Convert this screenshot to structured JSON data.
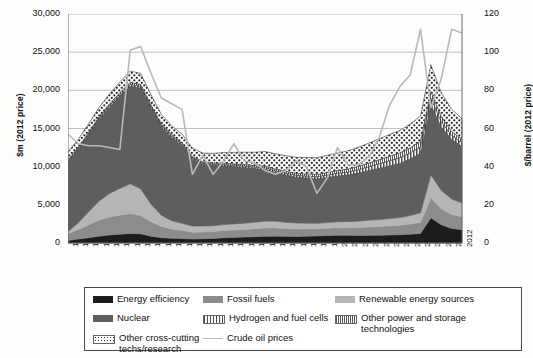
{
  "chart_data": {
    "type": "area",
    "title": "",
    "subtitle": "",
    "xlabel": "",
    "ylabel": "$m (2012 price)",
    "ylabel_right": "$/barrel (2012 price)",
    "ylim": [
      0,
      30000
    ],
    "ylim_right": [
      0,
      120
    ],
    "yticks": [
      "0",
      "5,000",
      "10,000",
      "15,000",
      "20,000",
      "25,000",
      "30,000"
    ],
    "ytick_values": [
      0,
      5000,
      10000,
      15000,
      20000,
      25000,
      30000
    ],
    "yticks_right": [
      "0",
      "20",
      "40",
      "60",
      "80",
      "100",
      "120"
    ],
    "ytick_values_right": [
      0,
      20,
      40,
      60,
      80,
      100,
      120
    ],
    "grid": true,
    "legend_position": "bottom",
    "stacked": true,
    "categories": [
      "1974",
      "1975",
      "1976",
      "1977",
      "1978",
      "1979",
      "1980",
      "1981",
      "1982",
      "1983",
      "1984",
      "1985",
      "1986",
      "1987",
      "1988",
      "1989",
      "1990",
      "1991",
      "1992",
      "1993",
      "1994",
      "1995",
      "1996",
      "1997",
      "1998",
      "1999",
      "2000",
      "2001",
      "2002",
      "2003",
      "2004",
      "2005",
      "2006",
      "2007",
      "2008",
      "2009",
      "2010",
      "2011",
      "2012"
    ],
    "series": [
      {
        "name": "Energy efficiency",
        "color": "#1c1c1c",
        "pattern": "solid",
        "values": [
          320,
          520,
          700,
          900,
          1050,
          1150,
          1250,
          1200,
          900,
          700,
          620,
          580,
          520,
          560,
          600,
          680,
          720,
          780,
          830,
          880,
          900,
          880,
          860,
          900,
          930,
          980,
          1020,
          1000,
          980,
          1000,
          1020,
          1050,
          1080,
          1150,
          1250,
          3300,
          2400,
          1900,
          1750
        ]
      },
      {
        "name": "Fossil fuels",
        "color": "#8c8c8c",
        "pattern": "solid",
        "values": [
          900,
          1250,
          1700,
          2100,
          2350,
          2500,
          2600,
          2400,
          1900,
          1500,
          1200,
          1050,
          900,
          880,
          900,
          950,
          980,
          1000,
          1050,
          1100,
          1080,
          1020,
          980,
          950,
          930,
          950,
          980,
          1000,
          1050,
          1100,
          1150,
          1200,
          1250,
          1350,
          1450,
          2600,
          2100,
          1850,
          1700
        ]
      },
      {
        "name": "Renewable energy sources",
        "color": "#b5b5b5",
        "pattern": "solid",
        "values": [
          250,
          900,
          1700,
          2500,
          3100,
          3500,
          3900,
          3500,
          2300,
          1450,
          1100,
          950,
          800,
          780,
          760,
          780,
          800,
          820,
          850,
          880,
          860,
          820,
          780,
          750,
          720,
          750,
          780,
          800,
          830,
          880,
          900,
          950,
          1000,
          1100,
          1250,
          3000,
          2400,
          2000,
          1800
        ]
      },
      {
        "name": "Nuclear",
        "color": "#5e5e5e",
        "pattern": "solid",
        "values": [
          9200,
          9600,
          10100,
          10700,
          11300,
          12100,
          12800,
          13200,
          12600,
          11600,
          10900,
          10200,
          8800,
          8100,
          7900,
          7700,
          7500,
          7300,
          7000,
          6800,
          6400,
          6200,
          6000,
          5900,
          5800,
          5900,
          6000,
          6100,
          6300,
          6500,
          6700,
          6900,
          7100,
          7400,
          7800,
          9200,
          8300,
          7800,
          7400
        ]
      },
      {
        "name": "Hydrogen and fuel cells",
        "color": "#6f6f6f",
        "pattern": "hatch-vertical",
        "values": [
          120,
          140,
          160,
          180,
          200,
          220,
          240,
          230,
          200,
          180,
          170,
          160,
          150,
          150,
          160,
          170,
          180,
          190,
          200,
          210,
          220,
          230,
          250,
          270,
          300,
          330,
          360,
          400,
          450,
          520,
          600,
          680,
          750,
          800,
          850,
          900,
          700,
          550,
          480
        ]
      },
      {
        "name": "Other power and storage technologies",
        "color": "#8a8a8a",
        "pattern": "hatch-fine",
        "values": [
          130,
          150,
          170,
          190,
          210,
          230,
          250,
          240,
          210,
          190,
          180,
          170,
          160,
          160,
          170,
          180,
          190,
          200,
          210,
          220,
          230,
          240,
          260,
          280,
          300,
          330,
          350,
          380,
          420,
          470,
          520,
          570,
          620,
          680,
          740,
          850,
          650,
          520,
          460
        ]
      },
      {
        "name": "Other cross-cutting techs/research",
        "color": "#ffffff",
        "pattern": "dotted",
        "values": [
          1000,
          1050,
          1100,
          1200,
          1300,
          1400,
          1500,
          1450,
          1350,
          1250,
          1200,
          1150,
          1100,
          1150,
          1250,
          1400,
          1500,
          1600,
          1750,
          1900,
          2000,
          2050,
          2100,
          2150,
          2200,
          2250,
          2300,
          2400,
          2500,
          2600,
          2750,
          2850,
          2950,
          3100,
          3300,
          3500,
          3150,
          2900,
          2700
        ]
      }
    ],
    "line_series": {
      "name": "Crude oil prices",
      "color": "#b9b9b9",
      "axis": "right",
      "unit": "$/barrel (2012 price)",
      "values": [
        57,
        52,
        51,
        51,
        50,
        49,
        101,
        103,
        89,
        76,
        73,
        70,
        36,
        46,
        36,
        43,
        52,
        43,
        42,
        38,
        36,
        38,
        43,
        40,
        26,
        34,
        50,
        41,
        41,
        45,
        55,
        72,
        82,
        88,
        112,
        71,
        86,
        112,
        110
      ]
    },
    "annotations": []
  },
  "legend": {
    "items": [
      {
        "label": "Energy efficiency",
        "swatch": "solid-black",
        "col": 0,
        "row": 0
      },
      {
        "label": "Fossil fuels",
        "swatch": "solid-mid",
        "col": 1,
        "row": 0
      },
      {
        "label": "Renewable energy sources",
        "swatch": "solid-light",
        "col": 2,
        "row": 0
      },
      {
        "label": "Nuclear",
        "swatch": "solid-dark",
        "col": 0,
        "row": 1
      },
      {
        "label": "Hydrogen and fuel cells",
        "swatch": "hatch-vertical",
        "col": 1,
        "row": 1
      },
      {
        "label": "Other power and storage technologies",
        "swatch": "hatch-fine",
        "col": 2,
        "row": 1
      },
      {
        "label": "Other cross-cutting techs/research",
        "swatch": "dotted",
        "col": 0,
        "row": 2
      },
      {
        "label": "Crude oil prices",
        "swatch": "line",
        "col": 1,
        "row": 2
      }
    ]
  }
}
